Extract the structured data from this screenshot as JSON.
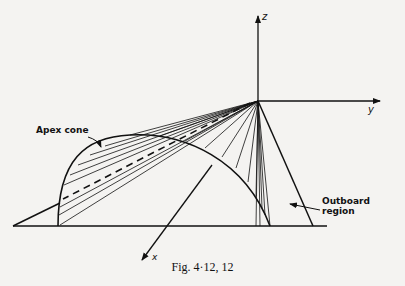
{
  "figure": {
    "caption": "Fig. 4·12, 12",
    "axes": {
      "z": "z",
      "y": "y",
      "x": "x"
    },
    "annotations": {
      "apex_cone": "Apex cone",
      "outboard_region": "Outboard region"
    },
    "colors": {
      "ink": "#111111",
      "paper": "#f4f3f1"
    }
  }
}
